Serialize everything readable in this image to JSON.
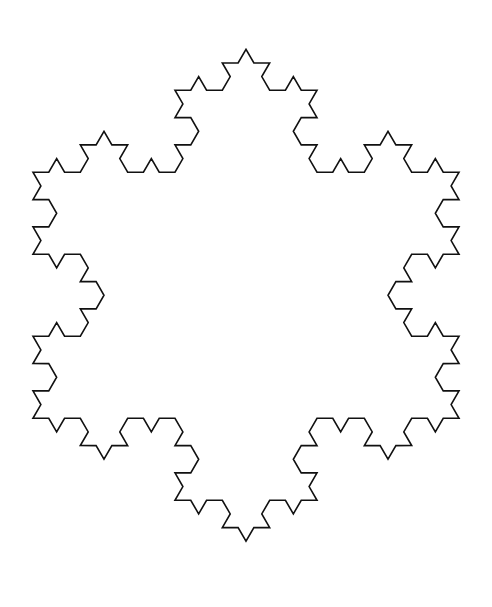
{
  "figure": {
    "name": "koch-snowflake",
    "title": "Koch Snowflake",
    "type": "fractal-curve",
    "iterations": 3,
    "base_shape": "equilateral-triangle",
    "base_orientation": "apex-down",
    "segment_count": 192,
    "stroke_color": "#111111",
    "stroke_width": 1.6,
    "fill": "none",
    "background_color": "#ffffff"
  },
  "canvas": {
    "width": 492,
    "height": 607
  },
  "chart_data": {
    "type": "line",
    "title": "Koch Snowflake",
    "subtitle": "",
    "xlabel": "",
    "ylabel": "",
    "grid": false,
    "legend": null,
    "axes_visible": false,
    "xlim": [
      0,
      492
    ],
    "ylim": [
      0,
      607
    ],
    "bounding_box": {
      "x_min": 33,
      "x_max": 459,
      "y_min": 37,
      "y_max": 578
    },
    "construction": {
      "rule": "koch-curve",
      "iterations": 3,
      "initiator_vertices": [
        [
          33.0,
          172.25
        ],
        [
          459.0,
          172.25
        ],
        [
          246.0,
          541.25
        ]
      ],
      "initiator_orientation": "apex-down",
      "side_length": 426,
      "bump_ratio": 0.3333333,
      "bump_angle_deg": 60,
      "segments_per_side": 64,
      "total_segments": 192,
      "total_vertices": 192,
      "center": [
        246.0,
        295.25
      ],
      "circumradius": 246.0
    },
    "extreme_points": {
      "top_spike": [
        246,
        37
      ],
      "bottom_spike": [
        246,
        578
      ],
      "upper_left_spike": [
        103,
        126
      ],
      "upper_right_spike": [
        390,
        126
      ],
      "left_spike": [
        33,
        295
      ],
      "right_spike": [
        459,
        295
      ]
    }
  }
}
